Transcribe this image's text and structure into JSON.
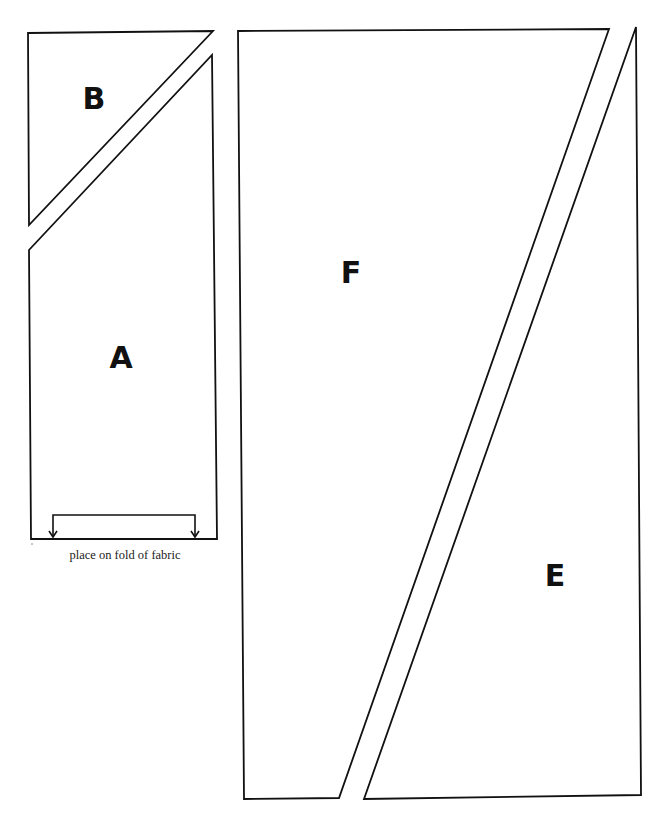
{
  "colors": {
    "background": "#ffffff",
    "stroke": "#111111",
    "text": "#111111"
  },
  "pieces": [
    {
      "id": "B",
      "label": "B",
      "shape": "triangle",
      "points": [
        [
          28,
          33
        ],
        [
          213,
          31
        ],
        [
          29,
          225
        ]
      ],
      "label_pos": [
        94,
        109
      ]
    },
    {
      "id": "A",
      "label": "A",
      "shape": "pentagon",
      "points": [
        [
          29,
          250
        ],
        [
          212,
          55
        ],
        [
          217,
          539
        ],
        [
          31,
          539
        ]
      ],
      "label_pos": [
        121,
        368
      ],
      "fold_note": "place on fold of fabric",
      "fold_bracket": {
        "left_x": 53,
        "right_x": 195,
        "top_y": 515,
        "bottom_y": 538
      }
    },
    {
      "id": "F",
      "label": "F",
      "shape": "quadrilateral",
      "points": [
        [
          238,
          31
        ],
        [
          609,
          29
        ],
        [
          339,
          798
        ],
        [
          244,
          799
        ]
      ],
      "label_pos": [
        351,
        283
      ]
    },
    {
      "id": "E",
      "label": "E",
      "shape": "quadrilateral",
      "points": [
        [
          636,
          27
        ],
        [
          641,
          795
        ],
        [
          364,
          799
        ]
      ],
      "label_pos": [
        555,
        586
      ]
    }
  ]
}
